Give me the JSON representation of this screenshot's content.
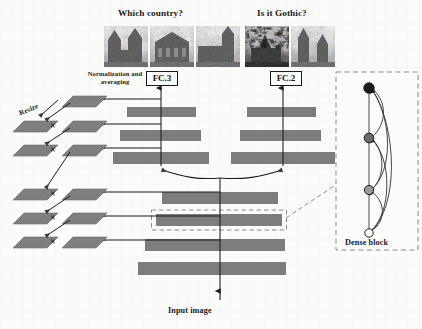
{
  "figure": {
    "type": "neural-network-architecture-diagram",
    "background_color": "#fbfbfa",
    "bar_color": "#7d7d7d",
    "outline_color": "#1b1b1b"
  },
  "questions": [
    {
      "id": "country",
      "label": "Which country?",
      "x": 118,
      "y": 8
    },
    {
      "id": "gothic",
      "label": "Is it Gothic?",
      "x": 257,
      "y": 8
    }
  ],
  "thumbnails": {
    "country": [
      {
        "name": "cathedral-photo-1",
        "x": 104,
        "y": 26,
        "w": 44,
        "h": 41,
        "seed": 11,
        "theme": "towers"
      },
      {
        "name": "cathedral-photo-2",
        "x": 150,
        "y": 26,
        "w": 44,
        "h": 41,
        "seed": 23,
        "theme": "facade"
      },
      {
        "name": "cathedral-photo-3",
        "x": 196,
        "y": 26,
        "w": 44,
        "h": 41,
        "seed": 37,
        "theme": "side"
      }
    ],
    "gothic": [
      {
        "name": "gothic-photo-1",
        "x": 245,
        "y": 26,
        "w": 44,
        "h": 41,
        "seed": 51,
        "theme": "dark"
      },
      {
        "name": "gothic-photo-2",
        "x": 291,
        "y": 26,
        "w": 44,
        "h": 41,
        "seed": 67,
        "theme": "spires"
      }
    ]
  },
  "labels": {
    "normalization": {
      "text": "Normalization and averaging",
      "x": 86,
      "y": 70
    },
    "resize": {
      "text": "Resize",
      "x": 18,
      "y": 110
    },
    "dense_block": {
      "text": "Dense block",
      "x": 345,
      "y": 238
    },
    "input_image": {
      "text": "Input image",
      "x": 168,
      "y": 306
    }
  },
  "fc_boxes": [
    {
      "name": "fc-3-box",
      "label": "FC.3",
      "x": 146,
      "y": 71,
      "w": 30
    },
    {
      "name": "fc-2-box",
      "label": "FC.2",
      "x": 270,
      "y": 71,
      "w": 30
    }
  ],
  "branches": {
    "left": {
      "name": "country-branch",
      "axis_x": 161,
      "bars": [
        {
          "x": 127,
          "y": 107,
          "w": 69,
          "h": 10
        },
        {
          "x": 120,
          "y": 130,
          "w": 81,
          "h": 11
        },
        {
          "x": 113,
          "y": 152,
          "w": 96,
          "h": 12
        }
      ]
    },
    "right": {
      "name": "gothic-branch",
      "axis_x": 283,
      "bars": [
        {
          "x": 247,
          "y": 107,
          "w": 69,
          "h": 10
        },
        {
          "x": 240,
          "y": 130,
          "w": 81,
          "h": 11
        },
        {
          "x": 231,
          "y": 152,
          "w": 104,
          "h": 12
        }
      ]
    }
  },
  "trunk": {
    "name": "shared-trunk",
    "axis_x": 220,
    "bars": [
      {
        "name": "trunk-bar-1",
        "x": 162,
        "y": 192,
        "w": 116,
        "h": 12,
        "dashed": false
      },
      {
        "name": "trunk-bar-2-dense-block",
        "x": 156,
        "y": 214,
        "w": 126,
        "h": 12,
        "dashed": true
      },
      {
        "name": "trunk-bar-3",
        "x": 145,
        "y": 239,
        "w": 140,
        "h": 12,
        "dashed": false
      },
      {
        "name": "trunk-bar-4",
        "x": 138,
        "y": 262,
        "w": 148,
        "h": 13,
        "dashed": false
      }
    ]
  },
  "feature_rows": [
    {
      "name": "feature-row-1",
      "y": 99,
      "left_para": null,
      "times": null,
      "right_para": {
        "x": 62,
        "y": 96
      }
    },
    {
      "name": "feature-row-2",
      "y": 124,
      "left_para": {
        "x": 13,
        "y": 121
      },
      "times": {
        "x": 50,
        "y": 120
      },
      "right_para": {
        "x": 62,
        "y": 121
      }
    },
    {
      "name": "feature-row-3",
      "y": 148,
      "left_para": {
        "x": 13,
        "y": 145
      },
      "times": {
        "x": 50,
        "y": 144
      },
      "right_para": {
        "x": 62,
        "y": 145
      }
    },
    {
      "name": "feature-row-4",
      "y": 192,
      "left_para": {
        "x": 13,
        "y": 189
      },
      "times": {
        "x": 50,
        "y": 188
      },
      "right_para": {
        "x": 62,
        "y": 189
      }
    },
    {
      "name": "feature-row-5",
      "y": 216,
      "left_para": {
        "x": 13,
        "y": 213
      },
      "times": {
        "x": 50,
        "y": 212
      },
      "right_para": {
        "x": 62,
        "y": 213
      }
    },
    {
      "name": "feature-row-6",
      "y": 240,
      "left_para": {
        "x": 13,
        "y": 237
      },
      "times": {
        "x": 50,
        "y": 236
      },
      "right_para": {
        "x": 62,
        "y": 237
      }
    }
  ],
  "times_symbol": "×",
  "dense_block_panel": {
    "name": "dense-block-panel",
    "x": 336,
    "y": 72,
    "w": 82,
    "h": 178,
    "border_style": "dashed",
    "border_color": "#8a8a8a",
    "nodes": [
      {
        "name": "dense-node-input",
        "cx": 369,
        "cy": 233,
        "r": 4.2,
        "fill": "#ffffff",
        "stroke": "#1b1b1b"
      },
      {
        "name": "dense-node-1",
        "cx": 369,
        "cy": 190,
        "r": 4.6,
        "fill": "#9a9a9a",
        "stroke": "#1b1b1b"
      },
      {
        "name": "dense-node-2",
        "cx": 369,
        "cy": 138,
        "r": 4.8,
        "fill": "#6b6b6b",
        "stroke": "#1b1b1b"
      },
      {
        "name": "dense-node-3",
        "cx": 369,
        "cy": 88,
        "r": 5.2,
        "fill": "#1a1a1a",
        "stroke": "#1a1a1a"
      }
    ]
  },
  "connectors": {
    "branch_split_note": "curved arrows from shared trunk top to both branch stacks",
    "dense_callout_note": "dashed leader line from highlighted trunk bar to dense block panel"
  }
}
